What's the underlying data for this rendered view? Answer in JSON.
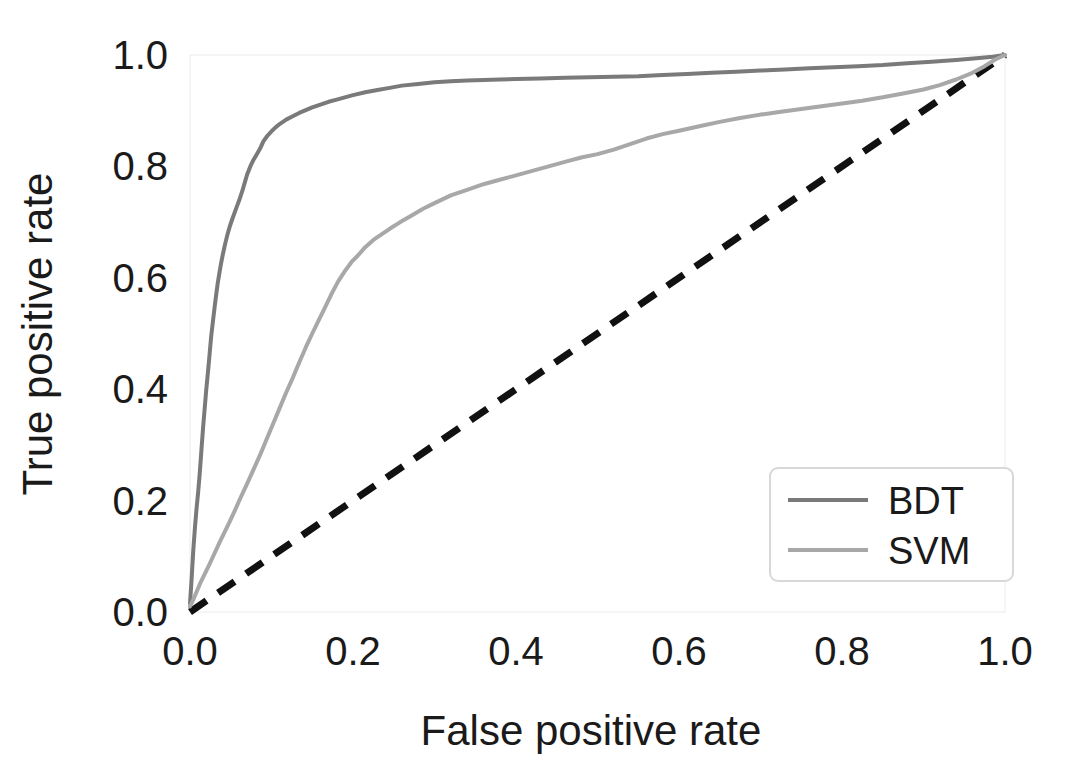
{
  "chart_data": {
    "type": "line",
    "title": "",
    "xlabel": "False positive rate",
    "ylabel": "True positive rate",
    "xlim": [
      0.0,
      1.0
    ],
    "ylim": [
      0.0,
      1.0
    ],
    "xticks": [
      "0.0",
      "0.2",
      "0.4",
      "0.6",
      "0.8",
      "1.0"
    ],
    "xtick_values": [
      0.0,
      0.2,
      0.4,
      0.6,
      0.8,
      1.0
    ],
    "yticks": [
      "0.0",
      "0.2",
      "0.4",
      "0.6",
      "0.8",
      "1.0"
    ],
    "ytick_values": [
      0.0,
      0.2,
      0.4,
      0.6,
      0.8,
      1.0
    ],
    "grid": false,
    "legend_position": "lower right",
    "series": [
      {
        "name": "BDT",
        "color": "#7a7a7a",
        "linestyle": "solid",
        "x": [
          0.0,
          0.002,
          0.004,
          0.006,
          0.008,
          0.01,
          0.012,
          0.014,
          0.016,
          0.018,
          0.02,
          0.022,
          0.024,
          0.026,
          0.028,
          0.03,
          0.032,
          0.034,
          0.036,
          0.038,
          0.04,
          0.043,
          0.046,
          0.049,
          0.052,
          0.055,
          0.058,
          0.061,
          0.064,
          0.067,
          0.07,
          0.074,
          0.078,
          0.082,
          0.086,
          0.09,
          0.095,
          0.1,
          0.105,
          0.11,
          0.118,
          0.126,
          0.134,
          0.142,
          0.15,
          0.16,
          0.17,
          0.18,
          0.19,
          0.2,
          0.215,
          0.23,
          0.245,
          0.26,
          0.28,
          0.3,
          0.32,
          0.34,
          0.36,
          0.38,
          0.4,
          0.43,
          0.46,
          0.49,
          0.52,
          0.55,
          0.58,
          0.61,
          0.64,
          0.67,
          0.7,
          0.73,
          0.76,
          0.79,
          0.82,
          0.85,
          0.88,
          0.91,
          0.94,
          0.965,
          0.985,
          1.0
        ],
        "y": [
          0.015,
          0.06,
          0.11,
          0.15,
          0.185,
          0.215,
          0.25,
          0.29,
          0.33,
          0.365,
          0.4,
          0.43,
          0.462,
          0.495,
          0.52,
          0.545,
          0.568,
          0.59,
          0.608,
          0.625,
          0.64,
          0.66,
          0.678,
          0.693,
          0.706,
          0.718,
          0.73,
          0.742,
          0.755,
          0.77,
          0.785,
          0.8,
          0.812,
          0.822,
          0.832,
          0.845,
          0.855,
          0.863,
          0.87,
          0.876,
          0.884,
          0.89,
          0.896,
          0.901,
          0.906,
          0.911,
          0.916,
          0.92,
          0.924,
          0.928,
          0.933,
          0.937,
          0.941,
          0.945,
          0.948,
          0.951,
          0.953,
          0.954,
          0.955,
          0.956,
          0.957,
          0.958,
          0.959,
          0.96,
          0.961,
          0.962,
          0.964,
          0.966,
          0.968,
          0.97,
          0.972,
          0.974,
          0.976,
          0.978,
          0.98,
          0.982,
          0.985,
          0.988,
          0.991,
          0.994,
          0.997,
          1.0
        ]
      },
      {
        "name": "SVM",
        "color": "#a8a8a8",
        "linestyle": "solid",
        "x": [
          0.0,
          0.004,
          0.008,
          0.012,
          0.018,
          0.024,
          0.03,
          0.036,
          0.042,
          0.048,
          0.055,
          0.062,
          0.07,
          0.078,
          0.086,
          0.094,
          0.102,
          0.11,
          0.118,
          0.126,
          0.134,
          0.142,
          0.15,
          0.158,
          0.166,
          0.174,
          0.182,
          0.19,
          0.198,
          0.206,
          0.215,
          0.225,
          0.235,
          0.245,
          0.258,
          0.272,
          0.286,
          0.3,
          0.32,
          0.34,
          0.36,
          0.38,
          0.4,
          0.42,
          0.44,
          0.46,
          0.48,
          0.5,
          0.52,
          0.54,
          0.56,
          0.58,
          0.6,
          0.625,
          0.65,
          0.675,
          0.7,
          0.725,
          0.75,
          0.775,
          0.8,
          0.825,
          0.85,
          0.875,
          0.9,
          0.92,
          0.94,
          0.96,
          0.975,
          0.988,
          1.0
        ],
        "y": [
          0.01,
          0.022,
          0.036,
          0.05,
          0.068,
          0.086,
          0.105,
          0.124,
          0.142,
          0.16,
          0.182,
          0.205,
          0.23,
          0.256,
          0.282,
          0.31,
          0.338,
          0.366,
          0.394,
          0.42,
          0.448,
          0.475,
          0.5,
          0.524,
          0.548,
          0.572,
          0.594,
          0.612,
          0.628,
          0.64,
          0.655,
          0.668,
          0.678,
          0.688,
          0.7,
          0.712,
          0.724,
          0.734,
          0.748,
          0.758,
          0.768,
          0.776,
          0.784,
          0.792,
          0.8,
          0.808,
          0.816,
          0.822,
          0.83,
          0.84,
          0.85,
          0.858,
          0.864,
          0.872,
          0.88,
          0.887,
          0.893,
          0.898,
          0.903,
          0.908,
          0.913,
          0.918,
          0.924,
          0.931,
          0.938,
          0.946,
          0.956,
          0.968,
          0.98,
          0.992,
          1.0
        ]
      }
    ],
    "reference_line": {
      "name": "chance-diagonal",
      "color": "#111111",
      "linestyle": "dashed",
      "x": [
        0.0,
        1.0
      ],
      "y": [
        0.0,
        1.0
      ]
    },
    "legend": [
      {
        "label": "BDT",
        "color": "#7a7a7a"
      },
      {
        "label": "SVM",
        "color": "#a8a8a8"
      }
    ]
  }
}
